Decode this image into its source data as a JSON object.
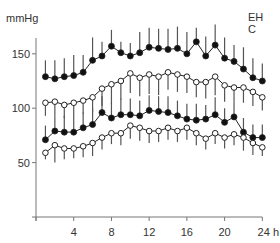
{
  "chart_data": {
    "type": "line",
    "title": "",
    "xlabel": "h",
    "ylabel": "mmHg",
    "x": [
      1,
      2,
      3,
      4,
      5,
      6,
      7,
      8,
      9,
      10,
      11,
      12,
      13,
      14,
      15,
      16,
      17,
      18,
      19,
      20,
      21,
      22,
      23,
      24
    ],
    "xticks": [
      0,
      4,
      8,
      12,
      16,
      20,
      24
    ],
    "xtick_labels": [
      "",
      "4",
      "8",
      "12",
      "16",
      "20",
      "24 h"
    ],
    "xlim": [
      0,
      24
    ],
    "yticks": [
      50,
      100,
      150
    ],
    "ytick_labels": [
      "50",
      "100",
      "150"
    ],
    "ylim": [
      0,
      170
    ],
    "grid": false,
    "legend": {
      "entries": [
        "EH",
        "C"
      ],
      "position": "top-right"
    },
    "series": [
      {
        "name": "EH systolic",
        "marker": "filled-circle",
        "error_direction": "up",
        "values": [
          129,
          127,
          129,
          130,
          133,
          144,
          148,
          157,
          151,
          148,
          151,
          156,
          155,
          154,
          155,
          150,
          161,
          148,
          158,
          146,
          143,
          136,
          128,
          125
        ],
        "error": [
          15,
          17,
          17,
          19,
          16,
          21,
          13,
          15,
          10,
          12,
          19,
          18,
          18,
          19,
          20,
          20,
          13,
          18,
          19,
          19,
          15,
          20,
          18,
          16
        ]
      },
      {
        "name": "C systolic",
        "marker": "open-circle",
        "error_direction": "down",
        "values": [
          105,
          106,
          103,
          105,
          107,
          110,
          118,
          122,
          125,
          132,
          128,
          131,
          129,
          133,
          131,
          129,
          124,
          124,
          129,
          121,
          119,
          119,
          115,
          110
        ],
        "error": [
          12,
          13,
          12,
          13,
          12,
          14,
          16,
          18,
          17,
          18,
          17,
          18,
          17,
          16,
          16,
          15,
          14,
          15,
          17,
          15,
          13,
          14,
          13,
          12
        ]
      },
      {
        "name": "EH diastolic",
        "marker": "filled-circle",
        "error_direction": "up",
        "values": [
          71,
          79,
          78,
          78,
          82,
          85,
          96,
          91,
          94,
          94,
          93,
          98,
          97,
          96,
          93,
          90,
          89,
          90,
          94,
          87,
          92,
          78,
          73,
          73
        ],
        "error": [
          13,
          14,
          15,
          14,
          14,
          15,
          15,
          14,
          15,
          15,
          14,
          14,
          14,
          15,
          14,
          14,
          15,
          13,
          16,
          13,
          14,
          13,
          12,
          12
        ]
      },
      {
        "name": "C diastolic",
        "marker": "open-circle",
        "error_direction": "down",
        "values": [
          59,
          66,
          63,
          63,
          65,
          68,
          73,
          77,
          77,
          84,
          82,
          79,
          79,
          82,
          79,
          82,
          77,
          72,
          77,
          73,
          76,
          73,
          68,
          64
        ],
        "error": [
          6,
          16,
          10,
          9,
          10,
          12,
          11,
          10,
          11,
          12,
          12,
          11,
          10,
          11,
          10,
          11,
          11,
          10,
          10,
          10,
          10,
          12,
          11,
          8
        ]
      }
    ]
  },
  "labels": {
    "y_unit": "mmHg",
    "legend_eh": "EH",
    "legend_c": "C"
  }
}
